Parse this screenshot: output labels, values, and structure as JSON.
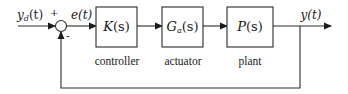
{
  "diagram": {
    "type": "feedback control block diagram",
    "input_signal": {
      "name": "y",
      "subscript": "d",
      "arg": "(t)"
    },
    "error_signal": {
      "label": "e(t)"
    },
    "output_signal": {
      "label": "y(t)"
    },
    "summing_junction": {
      "plus_sign": "+",
      "minus_sign": "-"
    },
    "blocks": [
      {
        "id": "controller",
        "tf_main": "K",
        "tf_sub": "",
        "tf_arg": "(s)",
        "caption": "controller"
      },
      {
        "id": "actuator",
        "tf_main": "G",
        "tf_sub": "a",
        "tf_arg": "(s)",
        "caption": "actuator"
      },
      {
        "id": "plant",
        "tf_main": "P",
        "tf_sub": "",
        "tf_arg": "(s)",
        "caption": "plant"
      }
    ],
    "feedback": "unity negative feedback from y(t) to summing junction"
  },
  "colors": {
    "line": "#2a2a2a",
    "text": "#1a1a1a",
    "background": "#ffffff"
  }
}
